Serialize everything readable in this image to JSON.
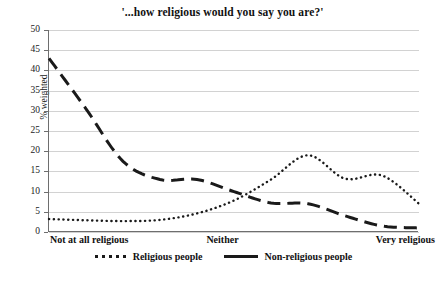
{
  "chart_data": {
    "type": "line",
    "title": "'...how religious would you say you are?'",
    "xlabel": "",
    "ylabel": "% weighted",
    "ylim": [
      0,
      50
    ],
    "yticks": [
      0,
      5,
      10,
      15,
      20,
      25,
      30,
      35,
      40,
      45,
      50
    ],
    "grid": true,
    "legend_position": "bottom",
    "x_axis_labels": {
      "left": "Not at all religious",
      "middle": "Neither",
      "right": "Very religious"
    },
    "x": [
      0,
      1,
      2,
      3,
      4,
      5,
      6,
      7,
      8,
      9,
      10
    ],
    "series": [
      {
        "name": "Religious people",
        "style": "dotted",
        "color": "#1a1a1a",
        "values": [
          3.2,
          2.9,
          2.7,
          3.0,
          4.6,
          7.8,
          13.0,
          19.0,
          13.2,
          14.0,
          7.0
        ]
      },
      {
        "name": "Non-religious people",
        "style": "dashed",
        "color": "#1a1a1a",
        "values": [
          43.0,
          30.5,
          17.5,
          13.0,
          13.0,
          10.0,
          7.2,
          7.0,
          4.0,
          1.5,
          1.0
        ]
      }
    ]
  },
  "legend": {
    "items": [
      {
        "label": "Religious people"
      },
      {
        "label": "Non-religious people"
      }
    ]
  },
  "axis": {
    "y_tick_labels": [
      "50",
      "45",
      "40",
      "35",
      "30",
      "25",
      "20",
      "15",
      "10",
      "5",
      "0"
    ]
  }
}
